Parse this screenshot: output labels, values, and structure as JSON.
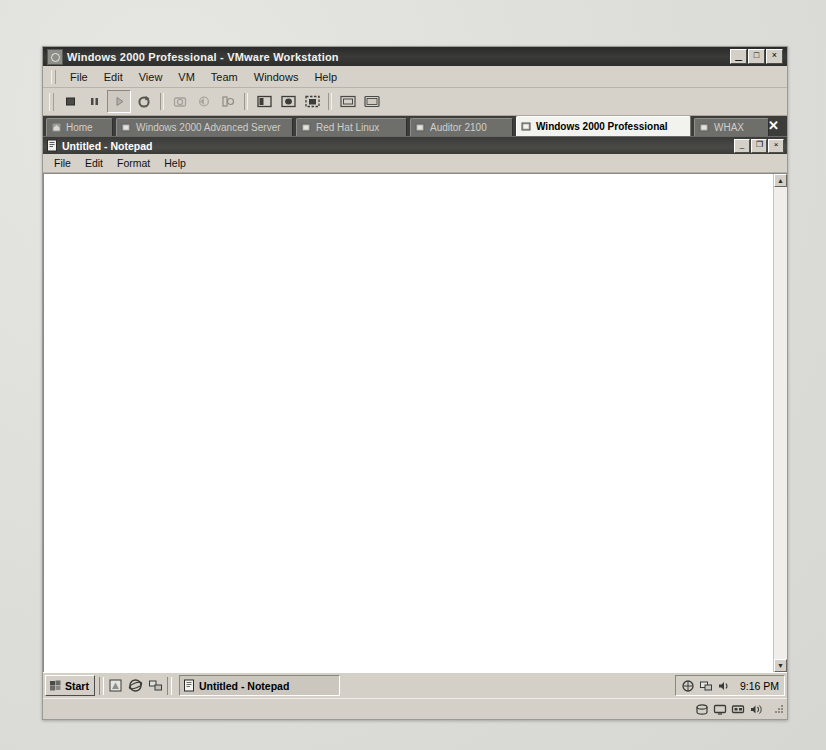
{
  "vmware": {
    "title": "Windows 2000 Professional - VMware Workstation",
    "app_icon": "vmware-logo-icon",
    "window_controls": {
      "minimize": "_",
      "maximize": "□",
      "close": "×"
    },
    "menu": [
      {
        "label": "File"
      },
      {
        "label": "Edit"
      },
      {
        "label": "View"
      },
      {
        "label": "VM"
      },
      {
        "label": "Team"
      },
      {
        "label": "Windows"
      },
      {
        "label": "Help"
      }
    ],
    "toolbar": [
      {
        "name": "power-off-button",
        "icon": "stop-square-icon",
        "enabled": true,
        "pressed": false
      },
      {
        "name": "suspend-button",
        "icon": "pause-icon",
        "enabled": true,
        "pressed": false
      },
      {
        "name": "power-on-button",
        "icon": "play-icon",
        "enabled": true,
        "pressed": true
      },
      {
        "name": "reset-button",
        "icon": "reset-circular-arrow-icon",
        "enabled": true,
        "pressed": false
      },
      {
        "name": "snapshot-button",
        "icon": "snapshot-camera-icon",
        "enabled": false,
        "pressed": false
      },
      {
        "name": "revert-snapshot-button",
        "icon": "revert-snapshot-icon",
        "enabled": false,
        "pressed": false
      },
      {
        "name": "snapshot-manager-button",
        "icon": "snapshot-manager-icon",
        "enabled": false,
        "pressed": false
      },
      {
        "name": "show-sidebar-button",
        "icon": "sidebar-panel-icon",
        "enabled": true,
        "pressed": false
      },
      {
        "name": "quick-switch-button",
        "icon": "quick-switch-icon",
        "enabled": true,
        "pressed": false
      },
      {
        "name": "full-screen-button",
        "icon": "fullscreen-icon",
        "enabled": true,
        "pressed": false
      },
      {
        "name": "summary-view-button",
        "icon": "summary-view-icon",
        "enabled": true,
        "pressed": false
      },
      {
        "name": "console-view-button",
        "icon": "console-view-icon",
        "enabled": true,
        "pressed": false
      }
    ],
    "tabs": [
      {
        "label": "Home",
        "icon": "home-icon",
        "active": false,
        "width": 54
      },
      {
        "label": "Windows 2000 Advanced Server",
        "icon": "vm-icon",
        "active": false,
        "width": 164
      },
      {
        "label": "Red Hat Linux",
        "icon": "vm-icon",
        "active": false,
        "width": 98
      },
      {
        "label": "Auditor 2100",
        "icon": "vm-icon",
        "active": false,
        "width": 90
      },
      {
        "label": "Windows 2000 Professional",
        "icon": "vm-icon",
        "active": true,
        "width": 162
      },
      {
        "label": "WHAX",
        "icon": "vm-icon",
        "active": false,
        "width": 62
      }
    ],
    "tabbar_close_label": "✕",
    "statusbar_icons": [
      {
        "name": "hard-disk-status-icon"
      },
      {
        "name": "display-status-icon"
      },
      {
        "name": "network-status-icon"
      },
      {
        "name": "sound-status-icon"
      }
    ]
  },
  "guest": {
    "notepad": {
      "title": "Untitled - Notepad",
      "icon": "notepad-icon",
      "menu": [
        {
          "label": "File"
        },
        {
          "label": "Edit"
        },
        {
          "label": "Format"
        },
        {
          "label": "Help"
        }
      ],
      "window_controls": {
        "minimize": "_",
        "restore": "❐",
        "close": "×"
      },
      "document_text": "",
      "scrollbar": {
        "up_arrow": "▲",
        "down_arrow": "▼"
      }
    },
    "taskbar": {
      "start_label": "Start",
      "start_icon": "windows-flag-icon",
      "quick_launch": [
        {
          "name": "show-desktop-icon"
        },
        {
          "name": "internet-explorer-icon"
        },
        {
          "name": "network-places-icon"
        }
      ],
      "tasks": [
        {
          "label": "Untitled - Notepad",
          "icon": "notepad-icon",
          "active": true
        }
      ],
      "tray_icons": [
        {
          "name": "network-connection-tray-icon"
        },
        {
          "name": "display-tray-icon"
        },
        {
          "name": "volume-tray-icon"
        }
      ],
      "clock": "9:16 PM"
    }
  },
  "colors": {
    "window_face": "#d4d0c8",
    "titlebar_dark": "#2e2e2c",
    "tabbar_bg": "#3c3c3a",
    "active_tab_bg": "#f2f2ee",
    "client_white": "#ffffff",
    "page_background": "#dededa"
  }
}
